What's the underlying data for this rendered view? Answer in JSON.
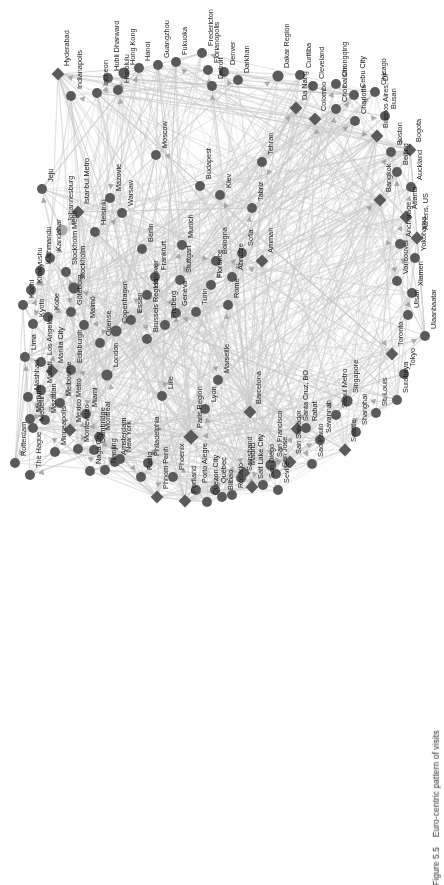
{
  "figure": {
    "caption_number": "Figure 5.5",
    "caption_text": "Euro-centric pattern of visits",
    "orientation": "rotated-90-ccw",
    "background_color": "#ffffff",
    "node_color": "#5a5a5a",
    "node_color_highlight": "#a8a8a8",
    "edge_color": "#c9c9c9",
    "label_color": "#1c1c1c",
    "label_font_size_px": 7.4
  },
  "chart_data": {
    "type": "scatter",
    "title": "Euro-centric pattern of visits",
    "xlabel": "",
    "ylabel": "",
    "legend": [],
    "node_shapes": [
      "circle",
      "diamond"
    ],
    "nodes": [
      {
        "label": "Hyderabad",
        "x": 58,
        "y": 74,
        "shape": "diamond",
        "size": 9
      },
      {
        "label": "Indianapolis",
        "x": 71,
        "y": 96,
        "shape": "circle",
        "size": 8
      },
      {
        "label": "Incheon",
        "x": 97,
        "y": 93,
        "shape": "circle",
        "size": 8
      },
      {
        "label": "Hubli Dharward",
        "x": 108,
        "y": 78,
        "shape": "circle",
        "size": 8
      },
      {
        "label": "Honolulu",
        "x": 118,
        "y": 90,
        "shape": "circle",
        "size": 8
      },
      {
        "label": "Hong Kong",
        "x": 124,
        "y": 73,
        "shape": "circle",
        "size": 9
      },
      {
        "label": "Hanoi",
        "x": 139,
        "y": 68,
        "shape": "circle",
        "size": 8
      },
      {
        "label": "Guangzhou",
        "x": 158,
        "y": 65,
        "shape": "circle",
        "size": 8
      },
      {
        "label": "Fukuoka",
        "x": 176,
        "y": 62,
        "shape": "circle",
        "size": 8
      },
      {
        "label": "Fredericton",
        "x": 202,
        "y": 53,
        "shape": "circle",
        "size": 8
      },
      {
        "label": "Florianopolis",
        "x": 208,
        "y": 70,
        "shape": "circle",
        "size": 8
      },
      {
        "label": "Detroit",
        "x": 212,
        "y": 86,
        "shape": "circle",
        "size": 8
      },
      {
        "label": "Denver",
        "x": 224,
        "y": 72,
        "shape": "circle",
        "size": 8
      },
      {
        "label": "Darkhan",
        "x": 238,
        "y": 80,
        "shape": "circle",
        "size": 8
      },
      {
        "label": "Dakar Region",
        "x": 278,
        "y": 76,
        "shape": "circle",
        "size": 9
      },
      {
        "label": "Curitiba",
        "x": 300,
        "y": 75,
        "shape": "circle",
        "size": 8
      },
      {
        "label": "Cleveland",
        "x": 313,
        "y": 86,
        "shape": "circle",
        "size": 8
      },
      {
        "label": "Chongqing",
        "x": 336,
        "y": 84,
        "shape": "circle",
        "size": 8
      },
      {
        "label": "Cebu City",
        "x": 354,
        "y": 95,
        "shape": "circle",
        "size": 8
      },
      {
        "label": "Chicago",
        "x": 375,
        "y": 92,
        "shape": "circle",
        "size": 8
      },
      {
        "label": "Da Nang",
        "x": 296,
        "y": 108,
        "shape": "diamond",
        "size": 9
      },
      {
        "label": "Colombo",
        "x": 315,
        "y": 119,
        "shape": "diamond",
        "size": 9
      },
      {
        "label": "Choibalsan",
        "x": 336,
        "y": 109,
        "shape": "circle",
        "size": 8
      },
      {
        "label": "Charlotte",
        "x": 355,
        "y": 121,
        "shape": "circle",
        "size": 8
      },
      {
        "label": "Busan",
        "x": 385,
        "y": 116,
        "shape": "circle",
        "size": 8
      },
      {
        "label": "Buenos Aires, DF",
        "x": 377,
        "y": 136,
        "shape": "diamond",
        "size": 9
      },
      {
        "label": "Boston",
        "x": 391,
        "y": 152,
        "shape": "circle",
        "size": 8
      },
      {
        "label": "Bogota",
        "x": 410,
        "y": 150,
        "shape": "diamond",
        "size": 9
      },
      {
        "label": "Beijing",
        "x": 397,
        "y": 172,
        "shape": "circle",
        "size": 8
      },
      {
        "label": "Auckland",
        "x": 411,
        "y": 187,
        "shape": "circle",
        "size": 8
      },
      {
        "label": "Bangkok",
        "x": 380,
        "y": 200,
        "shape": "diamond",
        "size": 9
      },
      {
        "label": "Atlanta",
        "x": 406,
        "y": 217,
        "shape": "diamond",
        "size": 9
      },
      {
        "label": "Athens, US",
        "x": 417,
        "y": 238,
        "shape": "diamond",
        "size": 9
      },
      {
        "label": "Anchorage",
        "x": 400,
        "y": 244,
        "shape": "circle",
        "size": 8
      },
      {
        "label": "Yokohama",
        "x": 415,
        "y": 258,
        "shape": "circle",
        "size": 8
      },
      {
        "label": "Vancouver",
        "x": 397,
        "y": 281,
        "shape": "circle",
        "size": 8
      },
      {
        "label": "Xiamen",
        "x": 412,
        "y": 293,
        "shape": "circle",
        "size": 8
      },
      {
        "label": "Ulsan",
        "x": 408,
        "y": 315,
        "shape": "circle",
        "size": 8
      },
      {
        "label": "Ulaanbaatar",
        "x": 425,
        "y": 336,
        "shape": "circle",
        "size": 8
      },
      {
        "label": "Toronto",
        "x": 392,
        "y": 354,
        "shape": "diamond",
        "size": 9
      },
      {
        "label": "Tokyo",
        "x": 404,
        "y": 374,
        "shape": "circle",
        "size": 8
      },
      {
        "label": "Surabaya",
        "x": 397,
        "y": 400,
        "shape": "circle",
        "size": 8
      },
      {
        "label": "Singapore",
        "x": 347,
        "y": 401,
        "shape": "circle",
        "size": 9
      },
      {
        "label": "St. Louis",
        "x": 376,
        "y": 413,
        "shape": "circle",
        "size": 8
      },
      {
        "label": "Seoul Metro",
        "x": 336,
        "y": 415,
        "shape": "circle",
        "size": 8
      },
      {
        "label": "Shanghai",
        "x": 356,
        "y": 432,
        "shape": "circle",
        "size": 8
      },
      {
        "label": "Seattle",
        "x": 345,
        "y": 450,
        "shape": "diamond",
        "size": 9
      },
      {
        "label": "Savannah",
        "x": 320,
        "y": 440,
        "shape": "circle",
        "size": 8
      },
      {
        "label": "Sao Paulo",
        "x": 312,
        "y": 464,
        "shape": "circle",
        "size": 8
      },
      {
        "label": "Santa Cruz, BO",
        "x": 297,
        "y": 429,
        "shape": "diamond",
        "size": 9
      },
      {
        "label": "San Salvador",
        "x": 290,
        "y": 462,
        "shape": "diamond",
        "size": 9
      },
      {
        "label": "San Jose",
        "x": 276,
        "y": 474,
        "shape": "circle",
        "size": 8
      },
      {
        "label": "San Francisco",
        "x": 271,
        "y": 465,
        "shape": "circle",
        "size": 9
      },
      {
        "label": "San Diego",
        "x": 263,
        "y": 485,
        "shape": "circle",
        "size": 8
      },
      {
        "label": "Salt Lake City",
        "x": 252,
        "y": 487,
        "shape": "diamond",
        "size": 9
      },
      {
        "label": "Sainshand",
        "x": 241,
        "y": 478,
        "shape": "circle",
        "size": 8
      },
      {
        "label": "Rosario",
        "x": 232,
        "y": 495,
        "shape": "circle",
        "size": 8
      },
      {
        "label": "Québec",
        "x": 215,
        "y": 490,
        "shape": "circle",
        "size": 8
      },
      {
        "label": "Quezon City",
        "x": 207,
        "y": 502,
        "shape": "circle",
        "size": 8
      },
      {
        "label": "Porto Alegre",
        "x": 196,
        "y": 490,
        "shape": "circle",
        "size": 8
      },
      {
        "label": "Portland",
        "x": 185,
        "y": 501,
        "shape": "diamond",
        "size": 9
      },
      {
        "label": "Phoenix",
        "x": 173,
        "y": 477,
        "shape": "circle",
        "size": 8
      },
      {
        "label": "Phnom Penh",
        "x": 157,
        "y": 497,
        "shape": "diamond",
        "size": 9
      },
      {
        "label": "Pasig",
        "x": 141,
        "y": 477,
        "shape": "circle",
        "size": 8
      },
      {
        "label": "Philadelphia",
        "x": 148,
        "y": 463,
        "shape": "circle",
        "size": 8
      },
      {
        "label": "New York",
        "x": 120,
        "y": 459,
        "shape": "circle",
        "size": 8
      },
      {
        "label": "Nanjing",
        "x": 105,
        "y": 470,
        "shape": "circle",
        "size": 8
      },
      {
        "label": "Naga City",
        "x": 90,
        "y": 471,
        "shape": "circle",
        "size": 8
      },
      {
        "label": "Montevideo",
        "x": 78,
        "y": 449,
        "shape": "circle",
        "size": 8
      },
      {
        "label": "Montreal",
        "x": 99,
        "y": 437,
        "shape": "circle",
        "size": 8
      },
      {
        "label": "Mexico Metro",
        "x": 70,
        "y": 430,
        "shape": "diamond",
        "size": 9
      },
      {
        "label": "Minneapolis",
        "x": 55,
        "y": 452,
        "shape": "circle",
        "size": 8
      },
      {
        "label": "Miami",
        "x": 86,
        "y": 414,
        "shape": "circle",
        "size": 8
      },
      {
        "label": "Melbourne",
        "x": 60,
        "y": 403,
        "shape": "circle",
        "size": 8
      },
      {
        "label": "Mazatlan",
        "x": 45,
        "y": 420,
        "shape": "circle",
        "size": 8
      },
      {
        "label": "Medellin",
        "x": 33,
        "y": 428,
        "shape": "circle",
        "size": 8
      },
      {
        "label": "Mashhad",
        "x": 28,
        "y": 397,
        "shape": "circle",
        "size": 8
      },
      {
        "label": "Marikina",
        "x": 30,
        "y": 419,
        "shape": "circle",
        "size": 8
      },
      {
        "label": "Manila City",
        "x": 52,
        "y": 371,
        "shape": "diamond",
        "size": 9
      },
      {
        "label": "Makati",
        "x": 41,
        "y": 390,
        "shape": "circle",
        "size": 8
      },
      {
        "label": "Los Angeles",
        "x": 41,
        "y": 362,
        "shape": "circle",
        "size": 8
      },
      {
        "label": "Lima",
        "x": 25,
        "y": 357,
        "shape": "circle",
        "size": 8
      },
      {
        "label": "Edinburgh",
        "x": 71,
        "y": 370,
        "shape": "circle",
        "size": 8
      },
      {
        "label": "Cambridge",
        "x": 94,
        "y": 450,
        "shape": "circle",
        "size": 8
      },
      {
        "label": "London",
        "x": 107,
        "y": 375,
        "shape": "circle",
        "size": 9
      },
      {
        "label": "Amsterdam",
        "x": 115,
        "y": 462,
        "shape": "circle",
        "size": 8
      },
      {
        "label": "Rotterdam",
        "x": 15,
        "y": 463,
        "shape": "circle",
        "size": 8
      },
      {
        "label": "The Hague",
        "x": 30,
        "y": 475,
        "shape": "circle",
        "size": 8
      },
      {
        "label": "Lille",
        "x": 162,
        "y": 396,
        "shape": "circle",
        "size": 8
      },
      {
        "label": "Paris Region",
        "x": 191,
        "y": 437,
        "shape": "diamond",
        "size": 11
      },
      {
        "label": "Lyon",
        "x": 205,
        "y": 409,
        "shape": "circle",
        "size": 8
      },
      {
        "label": "Marseille",
        "x": 218,
        "y": 380,
        "shape": "circle",
        "size": 8
      },
      {
        "label": "Barcelona",
        "x": 250,
        "y": 412,
        "shape": "diamond",
        "size": 9
      },
      {
        "label": "Bilbao",
        "x": 222,
        "y": 497,
        "shape": "circle",
        "size": 8
      },
      {
        "label": "Madrid",
        "x": 244,
        "y": 473,
        "shape": "diamond",
        "size": 9
      },
      {
        "label": "Seville",
        "x": 278,
        "y": 490,
        "shape": "circle",
        "size": 8
      },
      {
        "label": "Rabat",
        "x": 306,
        "y": 428,
        "shape": "circle",
        "size": 8
      },
      {
        "label": "Brussels Region",
        "x": 147,
        "y": 339,
        "shape": "circle",
        "size": 8
      },
      {
        "label": "Copenhagen",
        "x": 116,
        "y": 331,
        "shape": "circle",
        "size": 9
      },
      {
        "label": "Odense",
        "x": 100,
        "y": 343,
        "shape": "circle",
        "size": 8
      },
      {
        "label": "Malmö",
        "x": 84,
        "y": 325,
        "shape": "circle",
        "size": 8
      },
      {
        "label": "Göteborg",
        "x": 71,
        "y": 312,
        "shape": "circle",
        "size": 8
      },
      {
        "label": "Stockholm",
        "x": 74,
        "y": 288,
        "shape": "circle",
        "size": 9
      },
      {
        "label": "Stockholm Metro",
        "x": 66,
        "y": 272,
        "shape": "circle",
        "size": 8
      },
      {
        "label": "Kobe",
        "x": 48,
        "y": 317,
        "shape": "circle",
        "size": 8
      },
      {
        "label": "Kyoto",
        "x": 33,
        "y": 324,
        "shape": "circle",
        "size": 8
      },
      {
        "label": "Kitakyushu",
        "x": 31,
        "y": 290,
        "shape": "circle",
        "size": 8
      },
      {
        "label": "Kochi",
        "x": 23,
        "y": 305,
        "shape": "circle",
        "size": 8
      },
      {
        "label": "Kathmandu",
        "x": 40,
        "y": 271,
        "shape": "circle",
        "size": 8
      },
      {
        "label": "Kandahar",
        "x": 50,
        "y": 258,
        "shape": "circle",
        "size": 8
      },
      {
        "label": "Jeju",
        "x": 42,
        "y": 189,
        "shape": "circle",
        "size": 8
      },
      {
        "label": "Johannesburg",
        "x": 62,
        "y": 230,
        "shape": "circle",
        "size": 9
      },
      {
        "label": "Istanbul Metro",
        "x": 78,
        "y": 212,
        "shape": "diamond",
        "size": 9
      },
      {
        "label": "Helsinki",
        "x": 95,
        "y": 232,
        "shape": "circle",
        "size": 8
      },
      {
        "label": "Mazovie",
        "x": 110,
        "y": 198,
        "shape": "circle",
        "size": 8
      },
      {
        "label": "Warsaw",
        "x": 122,
        "y": 213,
        "shape": "circle",
        "size": 8
      },
      {
        "label": "Essen",
        "x": 131,
        "y": 320,
        "shape": "circle",
        "size": 8
      },
      {
        "label": "Hanover",
        "x": 147,
        "y": 295,
        "shape": "circle",
        "size": 8
      },
      {
        "label": "Berlin",
        "x": 142,
        "y": 249,
        "shape": "circle",
        "size": 8
      },
      {
        "label": "Frankfurt",
        "x": 155,
        "y": 277,
        "shape": "circle",
        "size": 8
      },
      {
        "label": "Freiberg",
        "x": 165,
        "y": 325,
        "shape": "circle",
        "size": 8
      },
      {
        "label": "Stuttgart",
        "x": 180,
        "y": 280,
        "shape": "circle",
        "size": 8
      },
      {
        "label": "Geneva",
        "x": 176,
        "y": 313,
        "shape": "circle",
        "size": 8
      },
      {
        "label": "Munich",
        "x": 182,
        "y": 245,
        "shape": "circle",
        "size": 8
      },
      {
        "label": "Turin",
        "x": 196,
        "y": 312,
        "shape": "circle",
        "size": 8
      },
      {
        "label": "Florence",
        "x": 211,
        "y": 285,
        "shape": "circle",
        "size": 8
      },
      {
        "label": "Bologna",
        "x": 216,
        "y": 261,
        "shape": "circle",
        "size": 8
      },
      {
        "label": "Rome",
        "x": 228,
        "y": 305,
        "shape": "circle",
        "size": 8
      },
      {
        "label": "Abruzze",
        "x": 232,
        "y": 277,
        "shape": "circle",
        "size": 8
      },
      {
        "label": "Sofia",
        "x": 242,
        "y": 253,
        "shape": "circle",
        "size": 8
      },
      {
        "label": "Kiev",
        "x": 220,
        "y": 195,
        "shape": "circle",
        "size": 8
      },
      {
        "label": "Budapest",
        "x": 200,
        "y": 186,
        "shape": "circle",
        "size": 8
      },
      {
        "label": "Moscow",
        "x": 156,
        "y": 155,
        "shape": "circle",
        "size": 8
      },
      {
        "label": "Tabriz",
        "x": 252,
        "y": 208,
        "shape": "circle",
        "size": 8
      },
      {
        "label": "Tehran",
        "x": 262,
        "y": 162,
        "shape": "circle",
        "size": 8
      },
      {
        "label": "Amman",
        "x": 262,
        "y": 261,
        "shape": "diamond",
        "size": 9
      }
    ]
  }
}
